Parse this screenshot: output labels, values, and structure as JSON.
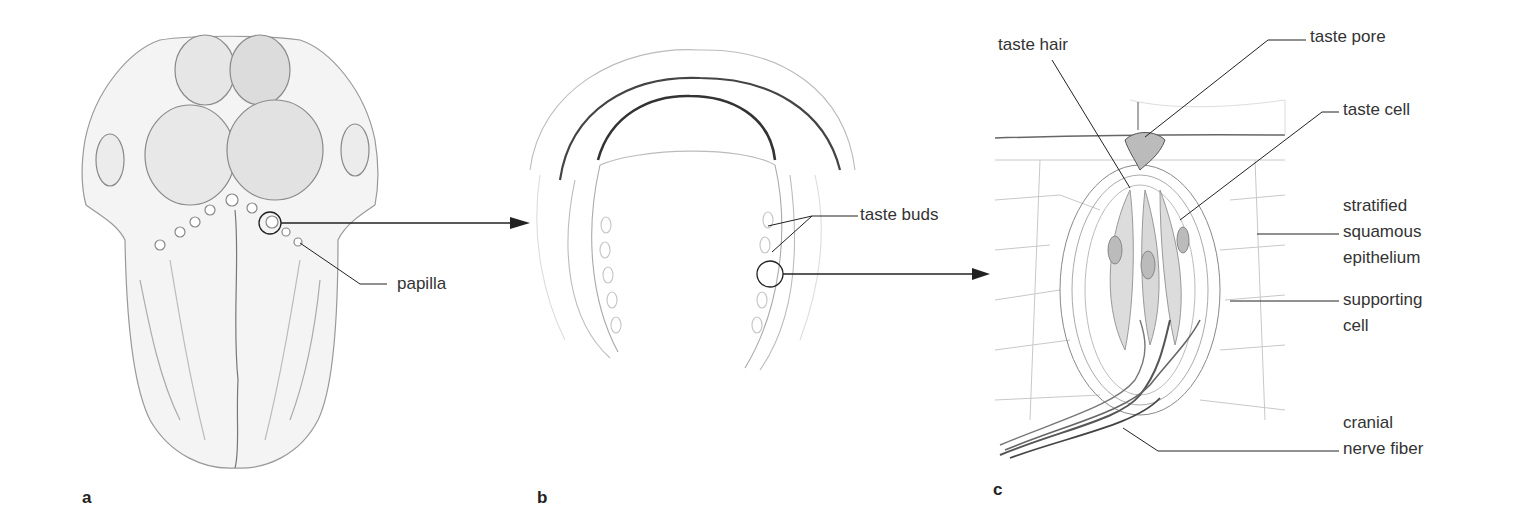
{
  "figure": {
    "panels": [
      {
        "id": "a",
        "letter": "a",
        "subject": "tongue dorsal surface",
        "labels": {
          "papilla": "papilla"
        }
      },
      {
        "id": "b",
        "letter": "b",
        "subject": "papilla cross-section",
        "labels": {
          "taste_buds": "taste buds"
        }
      },
      {
        "id": "c",
        "letter": "c",
        "subject": "taste bud detail",
        "labels": {
          "taste_hair": "taste hair",
          "taste_pore": "taste pore",
          "taste_cell": "taste cell",
          "stratified_1": "stratified",
          "stratified_2": "squamous",
          "stratified_3": "epithelium",
          "supporting_1": "supporting",
          "supporting_2": "cell",
          "cranial_1": "cranial",
          "cranial_2": "nerve fiber"
        }
      }
    ],
    "colors": {
      "line": "#222222",
      "sketch": "#8a8a8a",
      "light_sketch": "#c8c8c8",
      "taste_cell_fill": "#dcdcdc"
    }
  }
}
